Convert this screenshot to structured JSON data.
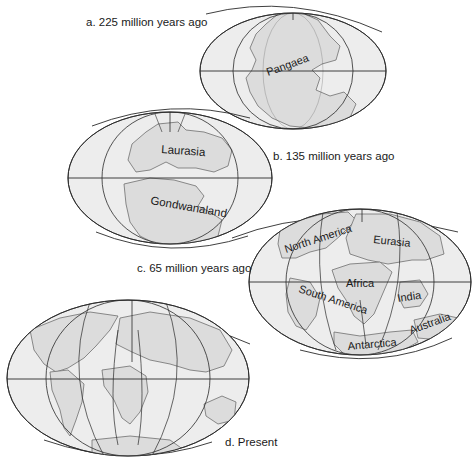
{
  "figure": {
    "colors": {
      "background": "#ffffff",
      "ocean": "#ededed",
      "land": "#dcdcdc",
      "grid": "#2a2a2a",
      "coast": "#6e6e6e",
      "text": "#1a1a1a"
    },
    "panels": [
      {
        "id": "a",
        "caption": "a. 225 million years ago",
        "continents": [
          {
            "name": "Pangaea"
          }
        ]
      },
      {
        "id": "b",
        "caption": "b. 135 million years ago",
        "continents": [
          {
            "name": "Laurasia"
          },
          {
            "name": "Gondwanaland"
          }
        ]
      },
      {
        "id": "c",
        "caption": "c. 65 million years ago",
        "continents": [
          {
            "name": "North America"
          },
          {
            "name": "Eurasia"
          },
          {
            "name": "South America"
          },
          {
            "name": "Africa"
          },
          {
            "name": "India"
          },
          {
            "name": "Australia"
          },
          {
            "name": "Antarctica"
          }
        ]
      },
      {
        "id": "d",
        "caption": "d. Present",
        "continents": []
      }
    ]
  }
}
